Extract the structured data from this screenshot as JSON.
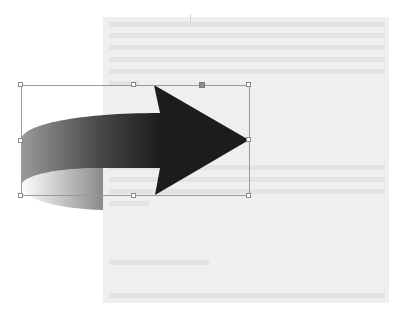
{
  "canvas": {
    "background": "#ffffff",
    "page_background": "#efefef"
  },
  "page": {
    "text_blocks": [
      {
        "lines": 5,
        "legible": false
      },
      {
        "lines": 3,
        "legible": false
      },
      {
        "lines": 1,
        "legible": false
      },
      {
        "lines": 1,
        "legible": false
      }
    ]
  },
  "shape": {
    "type": "curved-right-arrow",
    "fill_gradient": [
      "#ffffff",
      "#8a8a8a",
      "#1c1c1c"
    ],
    "head_color": "#1c1c1c",
    "selected": true
  },
  "selection": {
    "border_color": "#9a9a9a",
    "handle_fill": "#ffffff",
    "rotate_handle_color": "#8c8c8c",
    "handles": [
      "top-left",
      "top-center",
      "top-right",
      "middle-left",
      "middle-right",
      "bottom-left",
      "bottom-center",
      "bottom-right"
    ]
  }
}
